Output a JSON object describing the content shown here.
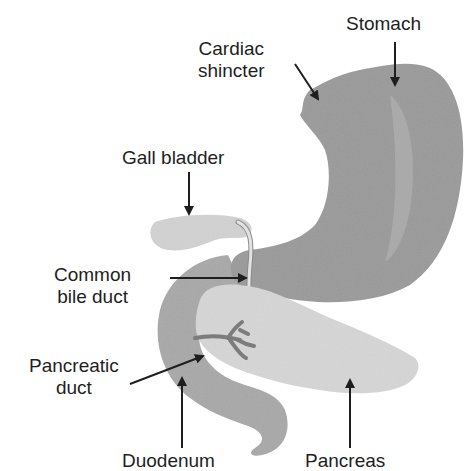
{
  "diagram": {
    "colors": {
      "stomach": "#9a9a9a",
      "duodenum": "#a8a8a8",
      "pancreas": "#d6d6d6",
      "gall_bladder": "#d2d2d2",
      "pancreatic_duct": "#7c7c7c",
      "arrow": "#1e1e1e",
      "text": "#1e1e1e"
    },
    "labels": {
      "stomach": "Stomach",
      "cardiac_line1": "Cardiac",
      "cardiac_line2": "shincter",
      "gall_bladder": "Gall bladder",
      "common_bile_line1": "Common",
      "common_bile_line2": "bile duct",
      "pancreatic_line1": "Pancreatic",
      "pancreatic_line2": "duct",
      "duodenum": "Duodenum",
      "pancreas": "Pancreas"
    }
  }
}
